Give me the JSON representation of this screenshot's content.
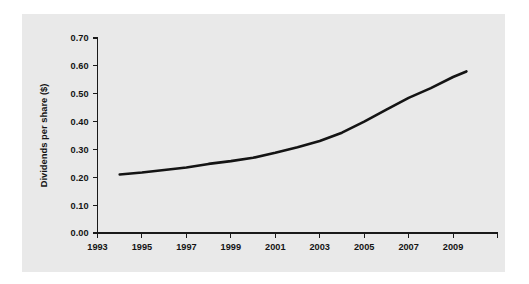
{
  "chart_data": {
    "type": "line",
    "title": "",
    "xlabel": "",
    "ylabel": "Dividends per share ($)",
    "grid": false,
    "legend": false,
    "legend_position": "none",
    "line_color": "#141414",
    "panel_color": "#e9e9e9",
    "page_color": "#ffffff",
    "xlim": [
      1993,
      2011
    ],
    "ylim": [
      0.0,
      0.7
    ],
    "x_tick_values": [
      1993,
      1995,
      1997,
      1999,
      2001,
      2003,
      2005,
      2007,
      2009,
      2011
    ],
    "x_tick_labels": [
      "1993",
      "1995",
      "1997",
      "1999",
      "2001",
      "2003",
      "2005",
      "2007",
      "2009",
      ""
    ],
    "y_tick_values": [
      0.0,
      0.1,
      0.2,
      0.3,
      0.4,
      0.5,
      0.6,
      0.7
    ],
    "y_tick_labels": [
      "0.00",
      "0.10",
      "0.20",
      "0.30",
      "0.40",
      "0.50",
      "0.60",
      "0.70"
    ],
    "series": [
      {
        "name": "Dividends per share",
        "x": [
          1994.0,
          1995.0,
          1996.0,
          1997.0,
          1998.0,
          1999.0,
          2000.0,
          2001.0,
          2002.0,
          2003.0,
          2004.0,
          2005.0,
          2006.0,
          2007.0,
          2008.0,
          2009.0,
          2009.6
        ],
        "values": [
          0.21,
          0.217,
          0.226,
          0.235,
          0.248,
          0.258,
          0.27,
          0.288,
          0.308,
          0.33,
          0.36,
          0.4,
          0.443,
          0.485,
          0.52,
          0.56,
          0.58
        ]
      }
    ]
  }
}
